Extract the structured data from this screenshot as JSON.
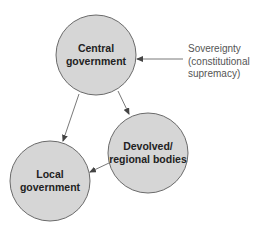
{
  "diagram": {
    "nodes": [
      {
        "id": "central",
        "label": "Central\ngovernment",
        "cx": 96,
        "cy": 55,
        "r": 40
      },
      {
        "id": "devolved",
        "label": "Devolved/\nregional bodies",
        "cx": 148,
        "cy": 153,
        "r": 40
      },
      {
        "id": "local",
        "label": "Local\ngovernment",
        "cx": 50,
        "cy": 181,
        "r": 40
      }
    ],
    "edges": [
      {
        "from": "central",
        "to": "local"
      },
      {
        "from": "central",
        "to": "devolved"
      },
      {
        "from": "devolved",
        "to": "local"
      },
      {
        "from": "sovereignty",
        "to": "central"
      }
    ],
    "annotation": {
      "label": "Sovereignty\n(constitutional\nsupremacy)"
    },
    "colors": {
      "node_fill": "#d6d6d6",
      "node_stroke": "#6a6a6a",
      "arrow": "#555555",
      "text": "#222222",
      "annotation_text": "#555555"
    }
  }
}
